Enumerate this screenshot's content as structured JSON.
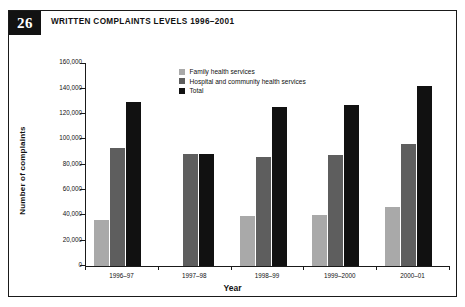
{
  "figure": {
    "number": "26",
    "title": "WRITTEN COMPLAINTS LEVELS 1996–2001"
  },
  "colors": {
    "family_health_services": "#a9a9a9",
    "hospital_and_community_health_services": "#5e5e5e",
    "total": "#111111",
    "axis": "#1a1a1a",
    "background": "#ffffff"
  },
  "chart_data": {
    "type": "bar",
    "title": "WRITTEN COMPLAINTS LEVELS 1996–2001",
    "xlabel": "Year",
    "ylabel": "Number of complaints",
    "ylim": [
      0,
      160000
    ],
    "ytick_labels": [
      "160,000",
      "140,000",
      "120,000",
      "100,000",
      "80,000",
      "60,000",
      "40,000",
      "20,000",
      "0"
    ],
    "ytick_values": [
      160000,
      140000,
      120000,
      100000,
      80000,
      60000,
      40000,
      20000,
      0
    ],
    "grid": false,
    "legend_position": "top-center",
    "categories": [
      "1996–97",
      "1997–98",
      "1998–99",
      "1999–2000",
      "2000–01"
    ],
    "series": [
      {
        "name": "Family health services",
        "values": [
          36000,
          null,
          39000,
          40000,
          46000
        ]
      },
      {
        "name": "Hospital and community health services",
        "values": [
          93000,
          88000,
          86000,
          87000,
          96000
        ]
      },
      {
        "name": "Total",
        "values": [
          129000,
          88000,
          125000,
          127000,
          142000
        ]
      }
    ]
  }
}
